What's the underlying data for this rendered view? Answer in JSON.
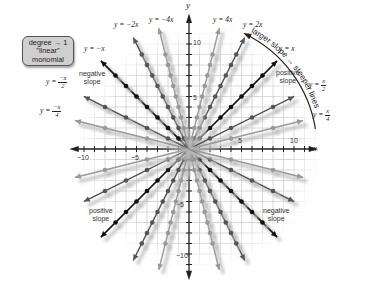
{
  "callout": {
    "line1": "degree → 1",
    "line2": "\"linear\"",
    "line3": "monomial"
  },
  "arc_label": "larger slope → steeper lines",
  "axes": {
    "x_label": "x",
    "y_label": "y",
    "x_ticks": [
      "−10",
      "−5",
      "5",
      "10"
    ],
    "y_ticks": [
      "10",
      "5",
      "−5",
      "−10"
    ]
  },
  "line_labels": {
    "neg_x": "y = −x",
    "neg_2x": "y = −2x",
    "neg_4x": "y = −4x",
    "pos_4x": "y = 4x",
    "pos_2x": "y = 2x",
    "pos_x": "y = x",
    "pos_half": {
      "prefix": "y = ",
      "num": "x",
      "den": "2"
    },
    "pos_quarter": {
      "prefix": "y = ",
      "num": "x",
      "den": "4"
    },
    "neg_half": {
      "prefix": "y = ",
      "num": "−x",
      "den": "2"
    },
    "neg_quarter": {
      "prefix": "y = ",
      "num": "−x",
      "den": "4"
    }
  },
  "notes": {
    "negative_slope_top": [
      "negative",
      "slope"
    ],
    "positive_slope_top": [
      "positive",
      "slope"
    ],
    "positive_slope_bottom": [
      "positive",
      "slope"
    ],
    "negative_slope_bottom": [
      "negative",
      "slope"
    ]
  },
  "colors": {
    "slope_1": "#111111",
    "slope_2": "#555555",
    "slope_4": "#999999",
    "grid": "#c8c8c8",
    "callout_bg": "#cfcfcf"
  },
  "chart_data": {
    "type": "line",
    "xlabel": "x",
    "ylabel": "y",
    "xlim": [
      -10,
      10
    ],
    "ylim": [
      -10,
      10
    ],
    "grid": true,
    "series": [
      {
        "name": "y = x",
        "slope": 1
      },
      {
        "name": "y = 2x",
        "slope": 2
      },
      {
        "name": "y = 4x",
        "slope": 4
      },
      {
        "name": "y = x/2",
        "slope": 0.5
      },
      {
        "name": "y = x/4",
        "slope": 0.25
      },
      {
        "name": "y = −x",
        "slope": -1
      },
      {
        "name": "y = −2x",
        "slope": -2
      },
      {
        "name": "y = −4x",
        "slope": -4
      },
      {
        "name": "y = −x/2",
        "slope": -0.5
      },
      {
        "name": "y = −x/4",
        "slope": -0.25
      }
    ],
    "annotations": [
      "degree → 1 \"linear\" monomial",
      "larger slope → steeper lines",
      "positive slope",
      "negative slope"
    ]
  }
}
